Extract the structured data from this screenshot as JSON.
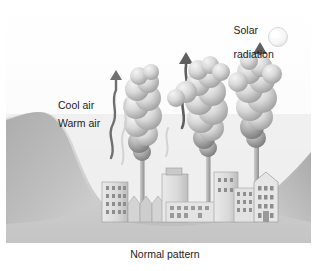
{
  "figure": {
    "caption": "Normal pattern",
    "labels": {
      "solar_line1": "Solar",
      "solar_line2": "radiation",
      "cool_air": "Cool air",
      "warm_air": "Warm air"
    },
    "colors": {
      "ink": "#1c1c1c",
      "sky": "#f2f2f2",
      "ground": "#b9b9b9",
      "hill_dark": "#9a9a9a",
      "smoke_light": "#e2e2e2",
      "smoke_mid": "#b5b5b5",
      "smoke_dark": "#7d7d7d",
      "arrow": "#6a6a6a",
      "building": "#d6d6d6",
      "sun": "#f7f7f7"
    }
  },
  "chart_data": {
    "type": "diagram",
    "title": "Normal pattern",
    "annotations": [
      {
        "name": "solar-radiation",
        "text": "Solar radiation",
        "x": 262,
        "y": 22
      },
      {
        "name": "cool-air",
        "text": "Cool air",
        "x": 88,
        "y": 105
      },
      {
        "name": "warm-air",
        "text": "Warm air",
        "x": 90,
        "y": 123
      },
      {
        "name": "caption",
        "text": "Normal pattern",
        "x": 165,
        "y": 256
      }
    ],
    "elements": [
      {
        "name": "sun",
        "type": "circle",
        "cx": 278,
        "cy": 37,
        "r": 9
      },
      {
        "name": "left-hill",
        "type": "terrain",
        "peak_x": 36,
        "peak_y": 112
      },
      {
        "name": "right-hill",
        "type": "terrain",
        "peak_x": 305,
        "peak_y": 150
      },
      {
        "name": "valley-floor",
        "type": "terrain",
        "y": 222
      },
      {
        "name": "smokestack-1",
        "x": 150,
        "base_y": 205,
        "top_y": 152
      },
      {
        "name": "smokestack-2",
        "x": 210,
        "base_y": 208,
        "top_y": 150
      },
      {
        "name": "smokestack-3",
        "x": 262,
        "base_y": 205,
        "top_y": 140
      },
      {
        "name": "plume-1",
        "x": 140,
        "y": 70
      },
      {
        "name": "plume-2",
        "x": 196,
        "y": 62
      },
      {
        "name": "plume-3",
        "x": 252,
        "y": 60
      },
      {
        "name": "rising-arrow-1",
        "x": 112,
        "from_y": 160,
        "to_y": 64
      },
      {
        "name": "rising-arrow-2",
        "x": 183,
        "from_y": 130,
        "to_y": 56
      },
      {
        "name": "rising-arrow-3",
        "x": 257,
        "from_y": 120,
        "to_y": 45
      }
    ]
  }
}
